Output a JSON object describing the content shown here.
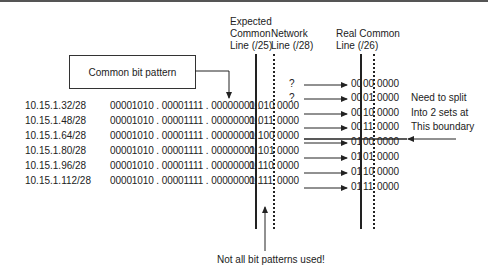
{
  "headers": {
    "expected": [
      "Expected",
      "Common",
      "Line (/25)"
    ],
    "network": [
      "Network",
      "Line (/28)"
    ],
    "real": [
      "Real Common",
      "Line (/26)"
    ]
  },
  "callout_box": "Common bit pattern",
  "rows": [
    {
      "ip": "10.15.1.32/28",
      "bits": "00001010 . 00001111 . 00000001 . 0010",
      "tail": "0000",
      "pre": "0",
      "mid": "010"
    },
    {
      "ip": "10.15.1.48/28",
      "bits": "00001010 . 00001111 . 00000001 . 0011",
      "tail": "0000",
      "pre": "0",
      "mid": "011"
    },
    {
      "ip": "10.15.1.64/28",
      "bits": "00001010 . 00001111 . 00000001 . 0100",
      "tail": "0000",
      "pre": "0",
      "mid": "100"
    },
    {
      "ip": "10.15.1.80/28",
      "bits": "00001010 . 00001111 . 00000001 . 0101",
      "tail": "0000",
      "pre": "0",
      "mid": "101"
    },
    {
      "ip": "10.15.1.96/28",
      "bits": "00001010 . 00001111 . 00000001 . 0110",
      "tail": "0000",
      "pre": "0",
      "mid": "110"
    },
    {
      "ip": "10.15.1.112/28",
      "bits": "00001010 . 00001111 . 00000001 . 0111",
      "tail": "0000",
      "pre": "0",
      "mid": "111"
    }
  ],
  "bit_prefix": "00001010 . 00001111 . 00000001 . ",
  "unused": [
    "?",
    "?"
  ],
  "results": [
    {
      "a": "00",
      "b": "00",
      "c": "0000"
    },
    {
      "a": "00",
      "b": "01",
      "c": "0000"
    },
    {
      "a": "00",
      "b": "10",
      "c": "0000"
    },
    {
      "a": "00",
      "b": "11",
      "c": "0000"
    },
    {
      "a": "01",
      "b": "00",
      "c": "0000"
    },
    {
      "a": "01",
      "b": "01",
      "c": "0000"
    },
    {
      "a": "01",
      "b": "10",
      "c": "0000"
    },
    {
      "a": "01",
      "b": "11",
      "c": "0000"
    }
  ],
  "split_note": [
    "Need to split",
    "Into 2 sets at",
    "This boundary"
  ],
  "bottom_note": "Not all bit patterns used!"
}
